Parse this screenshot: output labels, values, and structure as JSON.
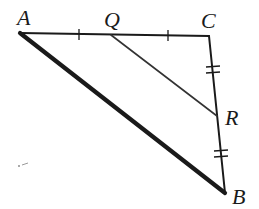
{
  "diagram": {
    "type": "triangle",
    "colors": {
      "stroke": "#1a1a1a",
      "segment_qr": "#333333",
      "background": "#ffffff"
    },
    "vertices": {
      "A": {
        "label": "A",
        "x": 20,
        "y": 33
      },
      "C": {
        "label": "C",
        "x": 209,
        "y": 36
      },
      "B": {
        "label": "B",
        "x": 225,
        "y": 193
      },
      "Q": {
        "label": "Q",
        "x": 111,
        "y": 35
      },
      "R": {
        "label": "R",
        "x": 217,
        "y": 116
      }
    },
    "labels": {
      "A": "A",
      "Q": "Q",
      "C": "C",
      "R": "R",
      "B": "B"
    },
    "segments": [
      {
        "name": "AC",
        "from": "A",
        "to": "C",
        "style": "normal"
      },
      {
        "name": "CB",
        "from": "C",
        "to": "B",
        "style": "normal"
      },
      {
        "name": "AB",
        "from": "A",
        "to": "B",
        "style": "thick"
      },
      {
        "name": "QR",
        "from": "Q",
        "to": "R",
        "style": "thin"
      }
    ],
    "congruence_marks": [
      {
        "segment": "AQ",
        "ticks": 1
      },
      {
        "segment": "QC",
        "ticks": 1
      },
      {
        "segment": "CR",
        "ticks": 2
      },
      {
        "segment": "RB",
        "ticks": 2
      }
    ]
  }
}
